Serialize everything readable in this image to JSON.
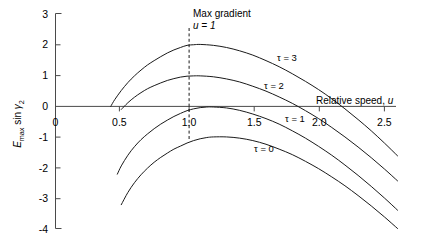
{
  "chart_data": {
    "type": "line",
    "title": "",
    "xlabel": "Relative speed, u",
    "ylabel": "E max sin γ2",
    "xlim": [
      0,
      2.75
    ],
    "ylim": [
      -4,
      3
    ],
    "grid": false,
    "legend_position": "inline-curve-labels",
    "x_ticks": [
      {
        "value": 0,
        "label": "0"
      },
      {
        "value": 0.5,
        "label": "0.5"
      },
      {
        "value": 1.0,
        "label": "1.0"
      },
      {
        "value": 1.5,
        "label": "1.5"
      },
      {
        "value": 2.0,
        "label": "2.0"
      },
      {
        "value": 2.5,
        "label": "2.5"
      }
    ],
    "y_ticks": [
      {
        "value": 3,
        "label": "3"
      },
      {
        "value": 2,
        "label": "2"
      },
      {
        "value": 1,
        "label": "1"
      },
      {
        "value": 0,
        "label": "0"
      },
      {
        "value": -1,
        "label": "-1"
      },
      {
        "value": -2,
        "label": "-2"
      },
      {
        "value": -3,
        "label": "-3"
      },
      {
        "value": -4,
        "label": "-4"
      }
    ],
    "annotations": [
      {
        "name": "max-gradient",
        "line1": "Max gradient",
        "line2": "u = 1",
        "x": 1.0,
        "style": "vertical-dashed"
      }
    ],
    "series": [
      {
        "name": "τ = 3",
        "label": "τ = 3",
        "label_x": 1.72,
        "label_y": 1.45,
        "peak": {
          "x": 1.0,
          "y": 2.0
        },
        "points": [
          [
            0.42,
            0.0
          ],
          [
            0.45,
            0.22
          ],
          [
            0.5,
            0.52
          ],
          [
            0.55,
            0.78
          ],
          [
            0.6,
            1.0
          ],
          [
            0.65,
            1.19
          ],
          [
            0.7,
            1.36
          ],
          [
            0.75,
            1.5
          ],
          [
            0.8,
            1.63
          ],
          [
            0.85,
            1.75
          ],
          [
            0.9,
            1.85
          ],
          [
            0.95,
            1.93
          ],
          [
            1.0,
            2.0
          ],
          [
            1.05,
            2.02
          ],
          [
            1.1,
            2.03
          ],
          [
            1.2,
            2.0
          ],
          [
            1.3,
            1.93
          ],
          [
            1.4,
            1.82
          ],
          [
            1.5,
            1.68
          ],
          [
            1.6,
            1.5
          ],
          [
            1.7,
            1.3
          ],
          [
            1.8,
            1.07
          ],
          [
            1.9,
            0.82
          ],
          [
            2.0,
            0.55
          ],
          [
            2.1,
            0.25
          ],
          [
            2.2,
            -0.08
          ],
          [
            2.3,
            -0.43
          ],
          [
            2.4,
            -0.8
          ],
          [
            2.5,
            -1.2
          ],
          [
            2.6,
            -1.62
          ]
        ]
      },
      {
        "name": "τ = 2",
        "label": "τ = 2",
        "label_x": 1.62,
        "label_y": 0.55,
        "peak": {
          "x": 1.05,
          "y": 1.0
        },
        "points": [
          [
            0.5,
            -0.1
          ],
          [
            0.55,
            0.12
          ],
          [
            0.6,
            0.3
          ],
          [
            0.65,
            0.45
          ],
          [
            0.7,
            0.58
          ],
          [
            0.75,
            0.68
          ],
          [
            0.8,
            0.77
          ],
          [
            0.85,
            0.85
          ],
          [
            0.9,
            0.91
          ],
          [
            0.95,
            0.96
          ],
          [
            1.0,
            0.99
          ],
          [
            1.05,
            1.0
          ],
          [
            1.1,
            1.0
          ],
          [
            1.2,
            0.97
          ],
          [
            1.3,
            0.9
          ],
          [
            1.4,
            0.8
          ],
          [
            1.5,
            0.66
          ],
          [
            1.6,
            0.5
          ],
          [
            1.7,
            0.31
          ],
          [
            1.8,
            0.1
          ],
          [
            1.9,
            -0.14
          ],
          [
            2.0,
            -0.4
          ],
          [
            2.1,
            -0.69
          ],
          [
            2.2,
            -1.0
          ],
          [
            2.3,
            -1.33
          ],
          [
            2.4,
            -1.68
          ],
          [
            2.5,
            -2.05
          ],
          [
            2.6,
            -2.44
          ]
        ]
      },
      {
        "name": "τ = 1",
        "label": "τ = 1",
        "label_x": 1.78,
        "label_y": -0.47,
        "peak": {
          "x": 1.1,
          "y": 0.0
        },
        "points": [
          [
            0.47,
            -2.22
          ],
          [
            0.5,
            -1.95
          ],
          [
            0.55,
            -1.6
          ],
          [
            0.6,
            -1.32
          ],
          [
            0.65,
            -1.09
          ],
          [
            0.7,
            -0.9
          ],
          [
            0.75,
            -0.73
          ],
          [
            0.8,
            -0.58
          ],
          [
            0.85,
            -0.45
          ],
          [
            0.9,
            -0.33
          ],
          [
            0.95,
            -0.23
          ],
          [
            1.0,
            -0.14
          ],
          [
            1.05,
            -0.08
          ],
          [
            1.1,
            -0.04
          ],
          [
            1.15,
            -0.02
          ],
          [
            1.2,
            -0.02
          ],
          [
            1.3,
            -0.05
          ],
          [
            1.4,
            -0.13
          ],
          [
            1.5,
            -0.25
          ],
          [
            1.6,
            -0.4
          ],
          [
            1.7,
            -0.58
          ],
          [
            1.8,
            -0.8
          ],
          [
            1.9,
            -1.04
          ],
          [
            2.0,
            -1.31
          ],
          [
            2.1,
            -1.6
          ],
          [
            2.2,
            -1.92
          ],
          [
            2.3,
            -2.26
          ],
          [
            2.4,
            -2.62
          ],
          [
            2.5,
            -3.0
          ],
          [
            2.6,
            -3.4
          ]
        ]
      },
      {
        "name": "τ = 0",
        "label": "τ = 0",
        "label_x": 1.55,
        "label_y": -1.45,
        "peak": {
          "x": 1.1,
          "y": -1.0
        },
        "points": [
          [
            0.5,
            -3.22
          ],
          [
            0.55,
            -2.82
          ],
          [
            0.6,
            -2.5
          ],
          [
            0.65,
            -2.24
          ],
          [
            0.7,
            -2.02
          ],
          [
            0.75,
            -1.83
          ],
          [
            0.8,
            -1.67
          ],
          [
            0.85,
            -1.53
          ],
          [
            0.9,
            -1.4
          ],
          [
            0.95,
            -1.3
          ],
          [
            1.0,
            -1.2
          ],
          [
            1.05,
            -1.12
          ],
          [
            1.1,
            -1.06
          ],
          [
            1.15,
            -1.02
          ],
          [
            1.2,
            -1.0
          ],
          [
            1.3,
            -1.0
          ],
          [
            1.4,
            -1.04
          ],
          [
            1.5,
            -1.12
          ],
          [
            1.6,
            -1.24
          ],
          [
            1.7,
            -1.4
          ],
          [
            1.8,
            -1.58
          ],
          [
            1.9,
            -1.8
          ],
          [
            2.0,
            -2.04
          ],
          [
            2.1,
            -2.31
          ],
          [
            2.2,
            -2.6
          ],
          [
            2.3,
            -2.92
          ],
          [
            2.4,
            -3.26
          ],
          [
            2.5,
            -3.62
          ],
          [
            2.6,
            -4.0
          ]
        ]
      }
    ]
  }
}
